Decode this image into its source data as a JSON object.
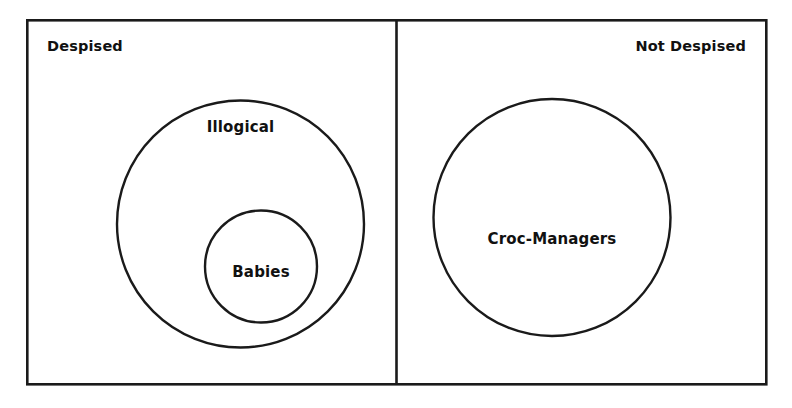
{
  "diagram": {
    "type": "euler-diagram",
    "background_color": "#ffffff",
    "stroke_color": "#1a1a1a",
    "text_color": "#111111",
    "panels": [
      {
        "id": "despised",
        "label": "Despised",
        "label_align": "left",
        "sets": [
          {
            "id": "illogical",
            "label": "Illogical"
          },
          {
            "id": "babies",
            "label": "Babies"
          }
        ]
      },
      {
        "id": "not-despised",
        "label": "Not Despised",
        "label_align": "right",
        "sets": [
          {
            "id": "croc-managers",
            "label": "Croc-Managers"
          }
        ]
      }
    ]
  }
}
